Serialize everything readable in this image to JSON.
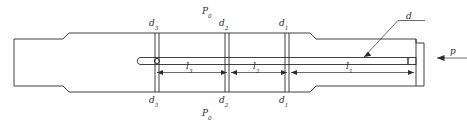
{
  "diagram": {
    "line_color": "#2b2b2b",
    "text_color": "#2b2b2b",
    "background": "#ffffff",
    "labels": {
      "d1_top": {
        "base": "d",
        "sub": "1"
      },
      "d2_top": {
        "base": "d",
        "sub": "2"
      },
      "d3_top": {
        "base": "d",
        "sub": "3"
      },
      "d1_bottom": {
        "base": "d",
        "sub": "1"
      },
      "d2_bottom": {
        "base": "d",
        "sub": "2"
      },
      "d3_bottom": {
        "base": "d",
        "sub": "3"
      },
      "p0_top": {
        "base": "P",
        "sub": "0"
      },
      "p0_bottom": {
        "base": "P",
        "sub": "0"
      },
      "l1": {
        "base": "l",
        "sub": "1"
      },
      "l2": {
        "base": "l",
        "sub": "2"
      },
      "l3": {
        "base": "l",
        "sub": "3"
      },
      "rod_diameter": "d",
      "pressure_force": "p"
    }
  }
}
